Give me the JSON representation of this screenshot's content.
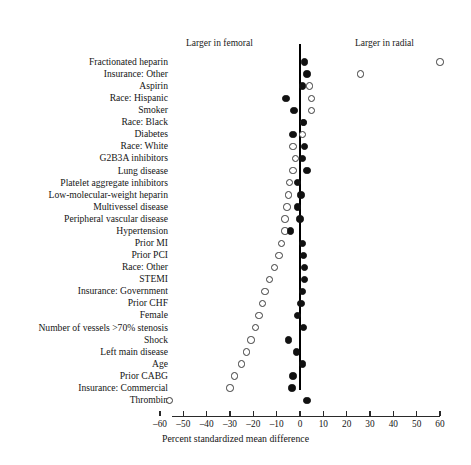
{
  "header": {
    "left_annotation": "Larger in femoral",
    "right_annotation": "Larger in radial"
  },
  "axis": {
    "xlabel": "Percent standardized mean difference",
    "ticks": [
      -60,
      -50,
      -40,
      -30,
      -20,
      -10,
      0,
      10,
      20,
      30,
      40,
      50,
      60
    ],
    "tick_labels": [
      "–60",
      "–50",
      "–40",
      "–30",
      "–20",
      "–10",
      "0",
      "10",
      "20",
      "30",
      "40",
      "50",
      "60"
    ],
    "xlim": [
      -62,
      62
    ],
    "zero_reference": 0
  },
  "colors": {
    "filled": "#111111",
    "open_stroke": "#3a3a3a",
    "open_fill": "#ffffff",
    "axis": "#2a2a2a",
    "text": "#151515",
    "background": "#ffffff"
  },
  "chart_data": {
    "type": "scatter",
    "title": "",
    "subtitle": "",
    "xlabel": "Percent standardized mean difference",
    "ylabel": "",
    "xlim": [
      -62,
      62
    ],
    "grid": false,
    "legend_position": "none",
    "orientation": "horizontal-dot-plot",
    "series": [
      {
        "name": "Unadjusted",
        "marker": "open-circle"
      },
      {
        "name": "Adjusted",
        "marker": "filled-circle"
      }
    ],
    "categories": [
      "Fractionated heparin",
      "Insurance: Other",
      "Aspirin",
      "Race: Hispanic",
      "Smoker",
      "Race: Black",
      "Diabetes",
      "Race: White",
      "G2B3A inhibitors",
      "Lung disease",
      "Platelet aggregate inhibitors",
      "Low-molecular-weight heparin",
      "Multivessel disease",
      "Peripheral vascular disease",
      "Hypertension",
      "Prior MI",
      "Prior PCI",
      "Race: Other",
      "STEMI",
      "Insurance: Government",
      "Female",
      "Prior CHF",
      "Number of vessels >70% stenosis",
      "Shock",
      "Left main disease",
      "Age",
      "Prior CABG",
      "Insurance: Commercial",
      "Thrombin"
    ],
    "points": [
      {
        "label": "Fractionated heparin",
        "open": 60.0,
        "filled": 2.0
      },
      {
        "label": "Insurance: Other",
        "open": 26.0,
        "filled": 3.0
      },
      {
        "label": "Aspirin",
        "open": 4.0,
        "filled": 1.0
      },
      {
        "label": "Race: Hispanic",
        "open": 5.0,
        "filled": -6.0
      },
      {
        "label": "Smoker",
        "open": 5.0,
        "filled": -2.5
      },
      {
        "label": "Race: Black",
        "open": 1.5,
        "filled": 1.5
      },
      {
        "label": "Diabetes",
        "open": 1.0,
        "filled": -3.0
      },
      {
        "label": "Race: White",
        "open": -3.0,
        "filled": 2.0
      },
      {
        "label": "G2B3A inhibitors",
        "open": -2.0,
        "filled": 1.0
      },
      {
        "label": "Lung disease",
        "open": -3.0,
        "filled": 3.0
      },
      {
        "label": "Platelet aggregate inhibitors",
        "open": -4.5,
        "filled": -1.0
      },
      {
        "label": "Low-molecular-weight heparin",
        "open": -5.0,
        "filled": 0.5
      },
      {
        "label": "Multivessel disease",
        "open": -5.5,
        "filled": -1.0
      },
      {
        "label": "Peripheral vascular disease",
        "open": -6.5,
        "filled": 0.0
      },
      {
        "label": "Hypertension",
        "open": -6.5,
        "filled": -4.0
      },
      {
        "label": "Prior MI",
        "open": -8.0,
        "filled": 1.0
      },
      {
        "label": "Prior PCI",
        "open": -9.0,
        "filled": 1.5
      },
      {
        "label": "Race: Other",
        "open": -11.0,
        "filled": 2.0
      },
      {
        "label": "STEMI",
        "open": -13.0,
        "filled": 2.0
      },
      {
        "label": "Insurance: Government",
        "open": -15.0,
        "filled": 1.0
      },
      {
        "label": "Prior CHF",
        "open": -16.0,
        "filled": 0.5
      },
      {
        "label": "Female",
        "open": -17.5,
        "filled": -1.0
      },
      {
        "label": "Number of vessels >70% stenosis",
        "open": -19.0,
        "filled": 1.5
      },
      {
        "label": "Shock",
        "open": -21.0,
        "filled": -5.0
      },
      {
        "label": "Left main disease",
        "open": -23.0,
        "filled": -1.5
      },
      {
        "label": "Age",
        "open": -25.0,
        "filled": 1.0
      },
      {
        "label": "Prior CABG",
        "open": -28.0,
        "filled": -3.0
      },
      {
        "label": "Insurance: Commercial",
        "open": -30.0,
        "filled": -3.5
      },
      {
        "label": "Thrombin",
        "open": -56.0,
        "filled": 3.0
      }
    ]
  }
}
